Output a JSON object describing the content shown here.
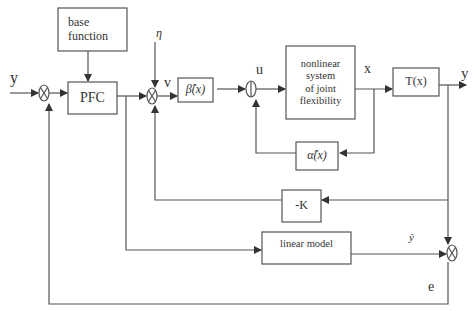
{
  "diagram": {
    "type": "control block diagram",
    "blocks": {
      "base_function": {
        "label_line1": "base",
        "label_line2": "function"
      },
      "pfc": {
        "label": "PFC"
      },
      "beta": {
        "label": "β̂(x)"
      },
      "nonlinear": {
        "line1": "nonlinear",
        "line2": "system",
        "line3": "of joint",
        "line4": "flexibility"
      },
      "transform": {
        "label": "T(x)"
      },
      "alpha": {
        "label": "α̂(x)"
      },
      "gain": {
        "label": "-K"
      },
      "linear_model": {
        "label": "linear model"
      }
    },
    "signals": {
      "input_y": "y",
      "eta": "η",
      "v": "v",
      "u": "u",
      "x": "x",
      "output_y": "y",
      "y_hat": "ŷ",
      "e": "e"
    },
    "colors": {
      "line": "#555555",
      "text": "#333333",
      "background": "#ffffff"
    }
  }
}
